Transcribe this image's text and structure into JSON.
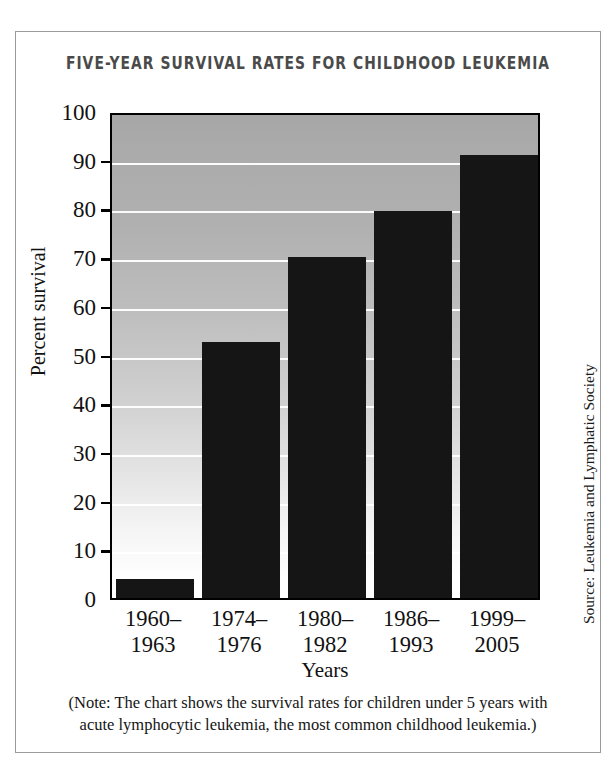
{
  "chart_data": {
    "type": "bar",
    "title": "FIVE-YEAR SURVIVAL RATES FOR CHILDHOOD LEUKEMIA",
    "categories": [
      "1960–\n1963",
      "1974–\n1976",
      "1980–\n1982",
      "1986–\n1993",
      "1999–\n2005"
    ],
    "category_lines": [
      [
        "1960–",
        "1963"
      ],
      [
        "1974–",
        "1976"
      ],
      [
        "1980–",
        "1982"
      ],
      [
        "1986–",
        "1993"
      ],
      [
        "1999–",
        "2005"
      ]
    ],
    "values": [
      4,
      52.5,
      70,
      79.5,
      91
    ],
    "xlabel": "Years",
    "ylabel": "Percent survival",
    "ylim": [
      0,
      100
    ],
    "ytick_labels": [
      "100",
      "90",
      "80",
      "70",
      "60",
      "50",
      "40",
      "30",
      "20",
      "10",
      "0"
    ],
    "ytick_values": [
      100,
      90,
      80,
      70,
      60,
      50,
      40,
      30,
      20,
      10,
      0
    ],
    "grid": true,
    "legend": null,
    "bar_color": "#151515",
    "plot_background": "vertical-gradient gray-to-white",
    "gridline_color": "#ffffff"
  },
  "source": {
    "text": "Source: Leukemia and Lymphatic Society"
  },
  "footnote": {
    "line1": "(Note: The chart shows the survival rates for children under 5 years with",
    "line2": "acute lymphocytic leukemia, the most common childhood leukemia.)"
  },
  "colors": {
    "frame": "#9b9b9b",
    "title": "#4a4a4a",
    "text": "#111111",
    "bar": "#151515"
  }
}
